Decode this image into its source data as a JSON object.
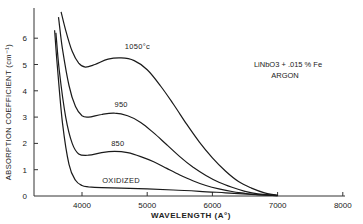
{
  "chart_data": {
    "type": "line",
    "title": "",
    "annotation": {
      "sample": "LiNbO3 + .015 % Fe",
      "atmosphere": "ARGON"
    },
    "xlabel": "WAVELENGTH (A°)",
    "ylabel": "ABSORPTION COEFFICIENT (cm⁻¹)",
    "xlim": [
      3300,
      8000
    ],
    "ylim": [
      0,
      7
    ],
    "x_ticks": [
      4000,
      5000,
      6000,
      7000,
      8000
    ],
    "y_ticks": [
      0,
      1,
      2,
      3,
      4,
      5,
      6
    ],
    "grid": false,
    "legend": "inline curve labels",
    "series": [
      {
        "name": "1050°c",
        "label": "1050°c",
        "x": [
          3680,
          3750,
          3850,
          3950,
          4050,
          4200,
          4400,
          4600,
          4800,
          5000,
          5200,
          5400,
          5600,
          5800,
          6000,
          6200,
          6400,
          6600,
          6800,
          7000
        ],
        "y": [
          7.0,
          6.3,
          5.5,
          5.05,
          4.9,
          5.0,
          5.2,
          5.25,
          5.15,
          4.8,
          4.2,
          3.5,
          2.75,
          2.05,
          1.45,
          0.95,
          0.55,
          0.3,
          0.12,
          0.03
        ]
      },
      {
        "name": "950",
        "label": "950",
        "x": [
          3640,
          3700,
          3800,
          3900,
          4000,
          4100,
          4300,
          4500,
          4700,
          4900,
          5100,
          5300,
          5500,
          5700,
          5900,
          6100,
          6300,
          6500,
          6700,
          7000
        ],
        "y": [
          6.8,
          5.6,
          4.2,
          3.4,
          3.05,
          3.0,
          3.1,
          3.15,
          3.05,
          2.8,
          2.4,
          1.95,
          1.5,
          1.1,
          0.78,
          0.52,
          0.33,
          0.18,
          0.08,
          0.02
        ]
      },
      {
        "name": "850",
        "label": "850",
        "x": [
          3600,
          3650,
          3750,
          3850,
          3950,
          4100,
          4300,
          4500,
          4700,
          4900,
          5100,
          5300,
          5500,
          5700,
          5900,
          6100,
          6300,
          6500,
          6700,
          7000
        ],
        "y": [
          6.2,
          4.8,
          3.0,
          2.0,
          1.6,
          1.55,
          1.65,
          1.7,
          1.65,
          1.5,
          1.3,
          1.05,
          0.8,
          0.58,
          0.4,
          0.27,
          0.17,
          0.1,
          0.05,
          0.01
        ]
      },
      {
        "name": "OXIDIZED",
        "label": "OXIDIZED",
        "x": [
          3580,
          3620,
          3700,
          3800,
          3900,
          4000,
          4100,
          4300,
          4600,
          5000,
          5400,
          5800,
          6200,
          6600,
          7000
        ],
        "y": [
          6.3,
          5.0,
          2.8,
          1.2,
          0.6,
          0.4,
          0.35,
          0.32,
          0.3,
          0.27,
          0.23,
          0.18,
          0.12,
          0.06,
          0.01
        ]
      }
    ],
    "label_positions": {
      "1050°c": [
        4850,
        5.6
      ],
      "950": [
        4600,
        3.4
      ],
      "850": [
        4550,
        1.9
      ],
      "OXIDIZED": [
        4600,
        0.5
      ]
    }
  },
  "axis_text": {
    "y_tick_labels": [
      "0",
      "1",
      "2",
      "3",
      "4",
      "5",
      "6"
    ],
    "x_tick_labels": [
      "4000",
      "5000",
      "6000",
      "7000",
      "8000"
    ]
  }
}
